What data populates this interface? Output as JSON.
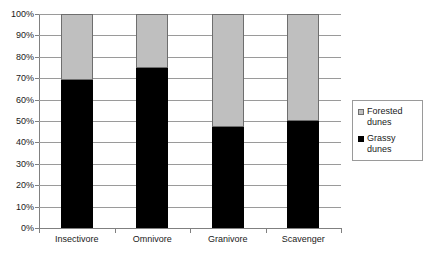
{
  "chart_data": {
    "type": "bar",
    "title": "",
    "subtitle": "",
    "xlabel": "",
    "ylabel": "",
    "stacked": true,
    "stack_mode": "percent",
    "grid": true,
    "legend_position": "right",
    "ylim": [
      0,
      100
    ],
    "ytick_labels": [
      "100%",
      "90%",
      "80%",
      "70%",
      "60%",
      "50%",
      "40%",
      "30%",
      "20%",
      "10%",
      "0%"
    ],
    "ytick_values": [
      100,
      90,
      80,
      70,
      60,
      50,
      40,
      30,
      20,
      10,
      0
    ],
    "categories": [
      "Insectivore",
      "Omnivore",
      "Granivore",
      "Scavenger"
    ],
    "series": [
      {
        "name": "Forested dunes",
        "color": "#bfbfbf",
        "values": [
          31,
          25,
          53,
          50
        ]
      },
      {
        "name": "Grassy dunes",
        "color": "#000000",
        "values": [
          69,
          75,
          47,
          50
        ]
      }
    ]
  },
  "legend": {
    "entries": [
      {
        "label_line1": "Forested",
        "label_line2": "dunes",
        "swatch": "forested-swatch"
      },
      {
        "label_line1": "Grassy",
        "label_line2": "dunes",
        "swatch": "grassy-swatch"
      }
    ]
  }
}
